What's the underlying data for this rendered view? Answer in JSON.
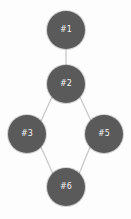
{
  "diagram": {
    "type": "directed-graph",
    "background_color": "#fdfdfd",
    "node_color": "#5a5a5a",
    "node_label_color": "#f2f2f2",
    "edge_color": "#c9c9c9",
    "node_radius": 19,
    "nodes": [
      {
        "id": "n1",
        "label": "#1",
        "cx": 66,
        "cy": 30,
        "r": 19
      },
      {
        "id": "n2",
        "label": "#2",
        "cx": 66,
        "cy": 84,
        "r": 19
      },
      {
        "id": "n3",
        "label": "#3",
        "cx": 27,
        "cy": 134,
        "r": 19
      },
      {
        "id": "n5",
        "label": "#5",
        "cx": 104,
        "cy": 134,
        "r": 19
      },
      {
        "id": "n6",
        "label": "#6",
        "cx": 66,
        "cy": 187,
        "r": 19
      }
    ],
    "edges": [
      {
        "from": "n1",
        "to": "n2",
        "x1": 66,
        "y1": 49,
        "x2": 66,
        "y2": 65
      },
      {
        "from": "n2",
        "to": "n3",
        "x1": 52,
        "y1": 97,
        "x2": 41,
        "y2": 121
      },
      {
        "from": "n2",
        "to": "n5",
        "x1": 80,
        "y1": 97,
        "x2": 91,
        "y2": 121
      },
      {
        "from": "n3",
        "to": "n6",
        "x1": 41,
        "y1": 147,
        "x2": 53,
        "y2": 174
      },
      {
        "from": "n5",
        "to": "n6",
        "x1": 90,
        "y1": 147,
        "x2": 79,
        "y2": 174
      }
    ]
  }
}
